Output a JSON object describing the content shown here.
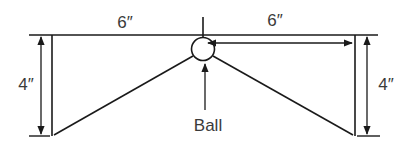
{
  "diagram": {
    "labels": {
      "top_left_width": "6″",
      "top_right_width": "6″",
      "left_height": "4″",
      "right_height": "4″",
      "ball": "Ball"
    },
    "colors": {
      "line": "#1a1a1a",
      "text": "#3a3a3a",
      "background": "#ffffff"
    }
  }
}
